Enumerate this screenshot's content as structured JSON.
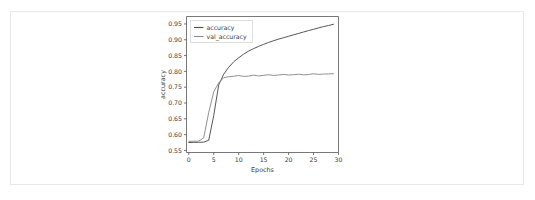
{
  "figure": {
    "background_color": "#ffffff",
    "frame_color": "#e8e8e8"
  },
  "chart_data": {
    "type": "line",
    "title": "",
    "xlabel": "Epochs",
    "ylabel": "accuracy",
    "xlim": [
      -0.45,
      30.0
    ],
    "ylim": [
      0.5435,
      0.9735
    ],
    "xticks": [
      0,
      5,
      10,
      15,
      20,
      25,
      30
    ],
    "xticklabels": [
      "0",
      "5",
      "10",
      "15",
      "20",
      "25",
      "30"
    ],
    "yticks": [
      0.55,
      0.6,
      0.65,
      0.7,
      0.75,
      0.8,
      0.85,
      0.9,
      0.95
    ],
    "yticklabels": [
      "0.55",
      "0.60",
      "0.65",
      "0.70",
      "0.75",
      "0.80",
      "0.85",
      "0.90",
      "0.95"
    ],
    "grid": false,
    "legend_position": "upper left",
    "x": [
      0,
      1,
      2,
      3,
      4,
      5,
      6,
      7,
      8,
      9,
      10,
      11,
      12,
      13,
      14,
      15,
      16,
      17,
      18,
      19,
      20,
      21,
      22,
      23,
      24,
      25,
      26,
      27,
      28,
      29
    ],
    "series": [
      {
        "name": "accuracy",
        "color": "#4d4d4d",
        "values": [
          0.575,
          0.5755,
          0.5758,
          0.5762,
          0.582,
          0.66,
          0.757,
          0.791,
          0.813,
          0.83,
          0.843,
          0.8545,
          0.864,
          0.872,
          0.879,
          0.8855,
          0.8915,
          0.897,
          0.902,
          0.9065,
          0.911,
          0.9155,
          0.92,
          0.9245,
          0.929,
          0.933,
          0.9375,
          0.9415,
          0.945,
          0.949
        ]
      },
      {
        "name": "val_accuracy",
        "color": "#8a8a8a",
        "values": [
          0.579,
          0.5792,
          0.5795,
          0.59,
          0.67,
          0.735,
          0.764,
          0.78,
          0.783,
          0.7845,
          0.787,
          0.784,
          0.785,
          0.788,
          0.7855,
          0.7875,
          0.7895,
          0.787,
          0.7885,
          0.7905,
          0.7885,
          0.7895,
          0.791,
          0.789,
          0.79,
          0.7925,
          0.7905,
          0.7915,
          0.792,
          0.7925
        ]
      }
    ]
  },
  "legend": {
    "entries": [
      {
        "label": "accuracy"
      },
      {
        "label": "val_accuracy"
      }
    ]
  }
}
